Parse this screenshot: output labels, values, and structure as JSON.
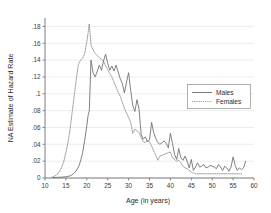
{
  "chart_data": {
    "type": "line",
    "title": "",
    "subtitle": "",
    "xlabel": "Age (in years)",
    "ylabel": "NA Estimate of Hazard Rate",
    "xlim": [
      10,
      60
    ],
    "ylim": [
      0,
      0.19
    ],
    "grid": "horizontal",
    "legend_position": "right-middle",
    "xticks": [
      10,
      15,
      20,
      25,
      30,
      35,
      40,
      45,
      50,
      55,
      60
    ],
    "xtick_labels": [
      "10",
      "15",
      "20",
      "25",
      "30",
      "35",
      "40",
      "45",
      "50",
      "55",
      "60"
    ],
    "yticks": [
      0,
      0.02,
      0.04,
      0.06,
      0.08,
      0.1,
      0.12,
      0.14,
      0.16,
      0.18
    ],
    "ytick_labels": [
      "0",
      ".02",
      ".04",
      ".06",
      ".08",
      ".1",
      ".12",
      ".14",
      ".16",
      ".18"
    ],
    "series": [
      {
        "name": "Males",
        "style": "solid",
        "color": "#6a6a6a",
        "x": [
          12,
          13,
          14,
          15,
          16,
          16.5,
          17,
          17.5,
          18,
          18.5,
          19,
          19.5,
          20,
          20.3,
          20.6,
          21,
          21.5,
          22,
          22.5,
          23,
          23.5,
          24,
          24.5,
          25,
          25.5,
          26,
          26.5,
          27,
          27.5,
          28,
          28.5,
          29,
          29.5,
          30,
          30.5,
          31,
          31.5,
          32,
          32.5,
          33,
          33.5,
          34,
          34.5,
          35,
          35.5,
          36,
          36.5,
          37,
          37.5,
          38,
          38.5,
          39,
          39.5,
          40,
          40.5,
          41,
          41.5,
          42,
          42.5,
          43,
          43.5,
          44,
          44.5,
          45,
          45.5,
          46,
          46.5,
          47,
          47.5,
          48,
          48.5,
          49,
          49.5,
          50,
          50.5,
          51,
          51.5,
          52,
          52.5,
          53,
          53.5,
          54,
          54.5,
          55,
          55.5,
          56,
          56.5,
          57,
          57.5,
          58
        ],
        "y": [
          0.0005,
          0.0008,
          0.001,
          0.0015,
          0.0025,
          0.004,
          0.006,
          0.009,
          0.013,
          0.02,
          0.03,
          0.045,
          0.062,
          0.074,
          0.08,
          0.14,
          0.125,
          0.12,
          0.127,
          0.134,
          0.128,
          0.139,
          0.147,
          0.136,
          0.128,
          0.133,
          0.127,
          0.134,
          0.126,
          0.118,
          0.112,
          0.101,
          0.114,
          0.125,
          0.104,
          0.086,
          0.079,
          0.093,
          0.082,
          0.052,
          0.046,
          0.049,
          0.043,
          0.045,
          0.066,
          0.054,
          0.047,
          0.042,
          0.04,
          0.042,
          0.044,
          0.041,
          0.036,
          0.053,
          0.041,
          0.028,
          0.022,
          0.035,
          0.024,
          0.021,
          0.026,
          0.02,
          0.012,
          0.022,
          0.009,
          0.013,
          0.018,
          0.013,
          0.014,
          0.016,
          0.012,
          0.013,
          0.015,
          0.014,
          0.013,
          0.011,
          0.016,
          0.013,
          0.009,
          0.014,
          0.012,
          0.008,
          0.013,
          0.025,
          0.015,
          0.009,
          0.012,
          0.01,
          0.012,
          0.02
        ]
      },
      {
        "name": "Females",
        "style": "dotted",
        "color": "#8a8a8a",
        "x": [
          11.5,
          12,
          12.5,
          13,
          13.5,
          14,
          14.5,
          15,
          15.5,
          16,
          16.5,
          17,
          17.5,
          18,
          18.5,
          19,
          19.5,
          20,
          20.3,
          20.6,
          21,
          21.5,
          22,
          22.5,
          23,
          23.5,
          24,
          24.5,
          25,
          25.5,
          26,
          26.5,
          27,
          27.5,
          28,
          28.5,
          29,
          29.5,
          30,
          30.5,
          31,
          31.5,
          32,
          32.5,
          33,
          33.5,
          34,
          34.5,
          35,
          35.5,
          36,
          36.5,
          37,
          37.5,
          38,
          38.5,
          39,
          39.5,
          40,
          40.5,
          41,
          41.5,
          42,
          42.5,
          43,
          43.5,
          44,
          44.5,
          45,
          45.5,
          46,
          47,
          48,
          49,
          50,
          51,
          52,
          53,
          54,
          55,
          56,
          57
        ],
        "y": [
          0.0008,
          0.0015,
          0.003,
          0.005,
          0.008,
          0.013,
          0.02,
          0.03,
          0.042,
          0.058,
          0.078,
          0.098,
          0.118,
          0.135,
          0.14,
          0.142,
          0.148,
          0.162,
          0.172,
          0.183,
          0.158,
          0.152,
          0.148,
          0.145,
          0.143,
          0.141,
          0.139,
          0.133,
          0.129,
          0.124,
          0.12,
          0.114,
          0.108,
          0.102,
          0.097,
          0.09,
          0.083,
          0.077,
          0.072,
          0.066,
          0.053,
          0.058,
          0.056,
          0.054,
          0.048,
          0.043,
          0.042,
          0.045,
          0.043,
          0.038,
          0.032,
          0.027,
          0.021,
          0.026,
          0.027,
          0.028,
          0.029,
          0.03,
          0.031,
          0.024,
          0.022,
          0.02,
          0.021,
          0.018,
          0.014,
          0.012,
          0.011,
          0.009,
          0.007,
          0.006,
          0.005,
          0.005,
          0.005,
          0.005,
          0.005,
          0.005,
          0.005,
          0.005,
          0.005,
          0.005,
          0.005,
          0.005
        ]
      }
    ]
  },
  "legend": {
    "items": [
      {
        "label": "Males"
      },
      {
        "label": "Females"
      }
    ]
  }
}
